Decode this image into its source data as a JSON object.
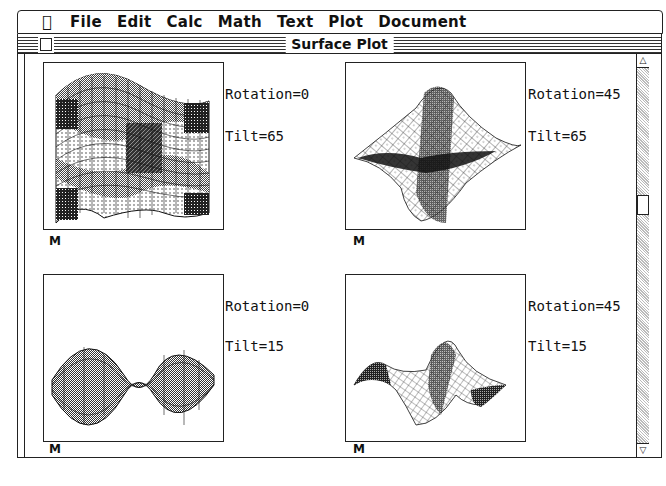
{
  "menubar": {
    "apple_icon": "",
    "apple_glyph": "⌘",
    "items": [
      "File",
      "Edit",
      "Calc",
      "Math",
      "Text",
      "Plot",
      "Document"
    ]
  },
  "window": {
    "title": "Surface Plot"
  },
  "plots": [
    {
      "rotation_label": "Rotation=0",
      "tilt_label": "Tilt=65",
      "marker": "M"
    },
    {
      "rotation_label": "Rotation=45",
      "tilt_label": "Tilt=65",
      "marker": "M"
    },
    {
      "rotation_label": "Rotation=0",
      "tilt_label": "Tilt=15",
      "marker": "M"
    },
    {
      "rotation_label": "Rotation=45",
      "tilt_label": "Tilt=15",
      "marker": "M"
    }
  ],
  "scrollbar": {
    "up_arrow": "△",
    "down_arrow": "▽"
  }
}
